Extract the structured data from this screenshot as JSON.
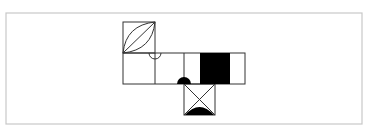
{
  "diagram": {
    "title": "Cube net figure",
    "description": "Unfolded cube net with patterned faces",
    "frame": {
      "x": 6,
      "y": 13,
      "width": 356,
      "height": 111,
      "stroke": "#c8c8c8"
    },
    "line_color": "#333333",
    "fill_color": "#000000",
    "faces": [
      {
        "id": "top-face",
        "x": 123,
        "y": 22,
        "size": 31,
        "pattern": "leaf-with-diagonal"
      },
      {
        "id": "middle-face-1",
        "x": 123,
        "y": 53,
        "width": 32,
        "height": 31,
        "pattern": "blank"
      },
      {
        "id": "middle-face-2",
        "x": 155,
        "y": 53,
        "width": 29,
        "height": 31,
        "pattern": "open-semicircle-top"
      },
      {
        "id": "middle-face-3",
        "x": 184,
        "y": 53,
        "width": 61,
        "height": 31,
        "pattern": "filled-semicircle-bottom-and-black-rect"
      },
      {
        "id": "bottom-face",
        "x": 184,
        "y": 84,
        "size": 31,
        "pattern": "x-with-filled-half-ellipse"
      }
    ]
  }
}
